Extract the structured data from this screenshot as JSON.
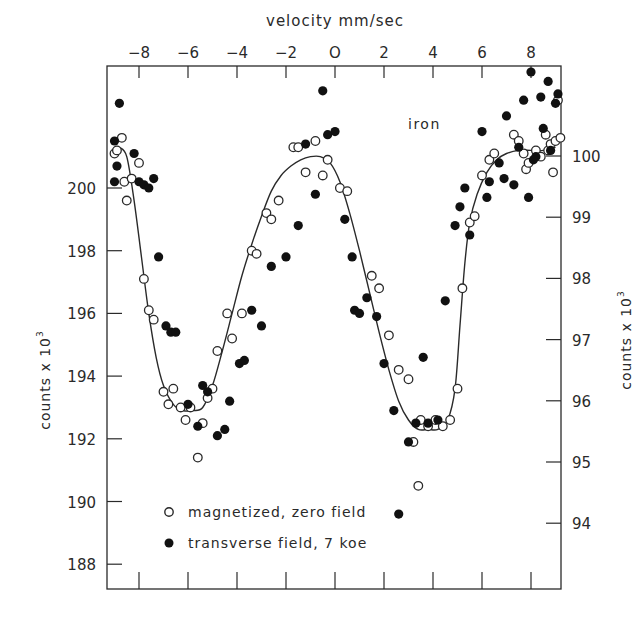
{
  "chart_data": {
    "type": "scatter",
    "title": "",
    "annotation": "iron",
    "xlabel": "velocity  mm/sec",
    "ylabel_left": "counts  x10³",
    "ylabel_right": "counts  x10³",
    "x_ticks": [
      -8,
      -6,
      -4,
      -2,
      0,
      2,
      4,
      6,
      8
    ],
    "x_tick_labels": [
      "-8",
      "-6",
      "-4",
      "-2",
      "O",
      "2",
      "4",
      "6",
      "8"
    ],
    "xlim": [
      -9.2,
      9.3
    ],
    "ylim_left": [
      187.2,
      203.9
    ],
    "y_ticks_left": [
      188,
      190,
      192,
      194,
      196,
      198,
      200
    ],
    "ylim_right": [
      93.6,
      101.5
    ],
    "y_ticks_right": [
      94,
      95,
      96,
      97,
      98,
      99,
      100
    ],
    "grid": false,
    "legend_position": "lower-left inside",
    "legend": [
      {
        "marker": "open-circle",
        "label": "magnetized, zero field"
      },
      {
        "marker": "filled-circle",
        "label": "transverse field, 7 koe"
      }
    ],
    "series": [
      {
        "name": "magnetized, zero field",
        "marker": "open-circle",
        "axis": "left",
        "points": [
          [
            -9.0,
            201.1
          ],
          [
            -8.9,
            201.2
          ],
          [
            -8.7,
            201.6
          ],
          [
            -8.6,
            200.2
          ],
          [
            -8.5,
            199.6
          ],
          [
            -8.3,
            200.3
          ],
          [
            -8.0,
            200.8
          ],
          [
            -7.8,
            197.1
          ],
          [
            -7.6,
            196.1
          ],
          [
            -7.4,
            195.8
          ],
          [
            -7.0,
            193.5
          ],
          [
            -6.8,
            193.1
          ],
          [
            -6.6,
            193.6
          ],
          [
            -6.3,
            193.0
          ],
          [
            -6.1,
            192.6
          ],
          [
            -5.9,
            193.0
          ],
          [
            -5.6,
            191.4
          ],
          [
            -5.4,
            192.5
          ],
          [
            -5.2,
            193.3
          ],
          [
            -5.0,
            193.6
          ],
          [
            -4.8,
            194.8
          ],
          [
            -4.4,
            196.0
          ],
          [
            -4.2,
            195.2
          ],
          [
            -3.8,
            196.0
          ],
          [
            -3.4,
            198.0
          ],
          [
            -3.2,
            197.9
          ],
          [
            -2.8,
            199.2
          ],
          [
            -2.6,
            199.0
          ],
          [
            -2.3,
            199.6
          ],
          [
            -1.7,
            201.3
          ],
          [
            -1.5,
            201.3
          ],
          [
            -1.2,
            200.5
          ],
          [
            -0.8,
            201.5
          ],
          [
            -0.5,
            200.4
          ],
          [
            -0.3,
            200.9
          ],
          [
            0.2,
            200.0
          ],
          [
            0.5,
            199.9
          ],
          [
            1.5,
            197.2
          ],
          [
            1.8,
            196.8
          ],
          [
            2.2,
            195.3
          ],
          [
            2.6,
            194.2
          ],
          [
            3.0,
            193.9
          ],
          [
            3.5,
            192.6
          ],
          [
            3.8,
            192.4
          ],
          [
            4.1,
            192.6
          ],
          [
            4.4,
            192.4
          ],
          [
            4.7,
            192.6
          ],
          [
            3.2,
            191.9
          ],
          [
            3.4,
            190.5
          ],
          [
            5.0,
            193.6
          ],
          [
            5.2,
            196.8
          ],
          [
            5.5,
            198.9
          ],
          [
            5.7,
            199.1
          ],
          [
            6.0,
            200.4
          ],
          [
            6.3,
            200.9
          ],
          [
            6.5,
            201.1
          ],
          [
            7.3,
            201.7
          ],
          [
            7.5,
            201.5
          ],
          [
            7.8,
            200.6
          ],
          [
            7.9,
            200.8
          ],
          [
            8.2,
            201.2
          ],
          [
            8.4,
            201.0
          ],
          [
            8.6,
            201.7
          ],
          [
            8.7,
            201.2
          ],
          [
            8.8,
            201.4
          ],
          [
            9.0,
            201.5
          ],
          [
            9.1,
            202.8
          ],
          [
            9.2,
            201.6
          ],
          [
            8.9,
            200.5
          ],
          [
            7.7,
            201.1
          ]
        ]
      },
      {
        "name": "transverse field, 7 koe",
        "marker": "filled-circle",
        "axis": "left",
        "points": [
          [
            -9.0,
            201.5
          ],
          [
            -8.8,
            202.7
          ],
          [
            -9.0,
            200.2
          ],
          [
            -8.9,
            200.7
          ],
          [
            -8.2,
            201.1
          ],
          [
            -8.0,
            200.2
          ],
          [
            -7.8,
            200.1
          ],
          [
            -7.6,
            200.0
          ],
          [
            -7.4,
            200.3
          ],
          [
            -7.2,
            197.8
          ],
          [
            -6.9,
            195.6
          ],
          [
            -6.7,
            195.4
          ],
          [
            -6.5,
            195.4
          ],
          [
            -6.0,
            193.1
          ],
          [
            -5.6,
            192.4
          ],
          [
            -5.4,
            193.7
          ],
          [
            -5.2,
            193.5
          ],
          [
            -4.8,
            192.1
          ],
          [
            -4.5,
            192.3
          ],
          [
            -4.3,
            193.2
          ],
          [
            -3.9,
            194.4
          ],
          [
            -3.7,
            194.5
          ],
          [
            -3.4,
            196.1
          ],
          [
            -3.0,
            195.6
          ],
          [
            -2.6,
            197.5
          ],
          [
            -2.0,
            197.8
          ],
          [
            -1.5,
            198.8
          ],
          [
            -1.2,
            201.4
          ],
          [
            -0.8,
            199.8
          ],
          [
            -0.5,
            203.1
          ],
          [
            -0.3,
            201.7
          ],
          [
            0.0,
            201.8
          ],
          [
            0.4,
            199.0
          ],
          [
            0.7,
            197.8
          ],
          [
            0.8,
            196.1
          ],
          [
            1.0,
            196.0
          ],
          [
            1.3,
            196.5
          ],
          [
            1.7,
            195.9
          ],
          [
            2.0,
            194.4
          ],
          [
            2.4,
            192.9
          ],
          [
            2.6,
            189.6
          ],
          [
            3.0,
            191.9
          ],
          [
            3.3,
            192.5
          ],
          [
            3.6,
            194.6
          ],
          [
            3.8,
            192.5
          ],
          [
            4.2,
            192.6
          ],
          [
            4.5,
            196.4
          ],
          [
            4.9,
            198.8
          ],
          [
            5.1,
            199.4
          ],
          [
            5.3,
            200.0
          ],
          [
            5.5,
            198.5
          ],
          [
            6.0,
            201.8
          ],
          [
            6.3,
            200.2
          ],
          [
            6.7,
            200.8
          ],
          [
            7.0,
            202.3
          ],
          [
            7.3,
            200.1
          ],
          [
            7.7,
            202.8
          ],
          [
            7.9,
            199.7
          ],
          [
            8.0,
            203.7
          ],
          [
            8.2,
            201.0
          ],
          [
            8.4,
            202.9
          ],
          [
            8.7,
            203.4
          ],
          [
            8.8,
            201.2
          ],
          [
            9.0,
            202.7
          ],
          [
            9.1,
            203.0
          ],
          [
            8.5,
            201.9
          ],
          [
            7.5,
            201.3
          ],
          [
            6.9,
            200.3
          ],
          [
            6.2,
            199.7
          ],
          [
            8.1,
            200.9
          ]
        ]
      },
      {
        "name": "fit curve",
        "marker": "line",
        "axis": "left",
        "points": [
          [
            -8.8,
            201.3
          ],
          [
            -8.5,
            201.0
          ],
          [
            -8.2,
            199.6
          ],
          [
            -7.9,
            197.8
          ],
          [
            -7.6,
            196.0
          ],
          [
            -7.3,
            194.6
          ],
          [
            -7.0,
            193.7
          ],
          [
            -6.6,
            193.1
          ],
          [
            -6.2,
            192.9
          ],
          [
            -5.8,
            192.9
          ],
          [
            -5.4,
            193.0
          ],
          [
            -5.0,
            193.7
          ],
          [
            -4.6,
            194.8
          ],
          [
            -4.2,
            196.0
          ],
          [
            -3.8,
            197.2
          ],
          [
            -3.4,
            198.2
          ],
          [
            -3.0,
            199.1
          ],
          [
            -2.6,
            199.9
          ],
          [
            -2.2,
            200.4
          ],
          [
            -1.8,
            200.7
          ],
          [
            -1.4,
            200.9
          ],
          [
            -1.0,
            201.0
          ],
          [
            -0.6,
            201.0
          ],
          [
            -0.2,
            200.8
          ],
          [
            0.2,
            200.2
          ],
          [
            0.6,
            199.2
          ],
          [
            1.0,
            198.0
          ],
          [
            1.4,
            196.7
          ],
          [
            1.8,
            195.4
          ],
          [
            2.2,
            194.2
          ],
          [
            2.6,
            193.2
          ],
          [
            3.0,
            192.6
          ],
          [
            3.4,
            192.3
          ],
          [
            3.8,
            192.3
          ],
          [
            4.2,
            192.3
          ],
          [
            4.6,
            192.6
          ],
          [
            4.9,
            193.6
          ],
          [
            5.1,
            195.6
          ],
          [
            5.3,
            197.6
          ],
          [
            5.5,
            198.9
          ],
          [
            5.8,
            199.8
          ],
          [
            6.2,
            200.5
          ],
          [
            6.6,
            200.9
          ],
          [
            7.0,
            201.1
          ],
          [
            7.5,
            201.2
          ],
          [
            8.0,
            201.2
          ],
          [
            8.5,
            201.2
          ],
          [
            9.0,
            201.3
          ]
        ]
      }
    ]
  },
  "labels": {
    "xlabel": "velocity  mm/sec",
    "ylabel_left": "counts  x 10",
    "ylabel_right": "counts  x 10",
    "ylabel_exp": "3",
    "annotation": "iron",
    "legend_open": "magnetized, zero field",
    "legend_filled": "transverse field, 7 koe"
  }
}
